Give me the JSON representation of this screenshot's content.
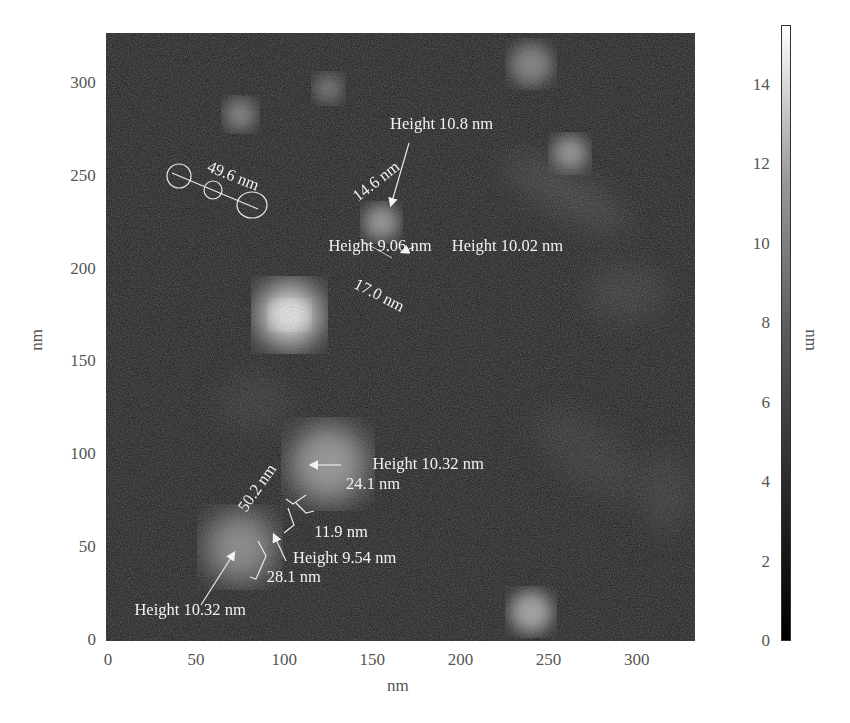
{
  "chart_data": {
    "type": "heatmap",
    "title": "",
    "xlabel": "nm",
    "ylabel": "nm",
    "xlim": [
      0,
      330
    ],
    "ylim": [
      0,
      330
    ],
    "x_ticks": [
      "0",
      "50",
      "100",
      "150",
      "200",
      "250",
      "300"
    ],
    "y_ticks": [
      "0",
      "50",
      "100",
      "150",
      "200",
      "250",
      "300"
    ],
    "colorbar": {
      "label": "nm",
      "range": [
        0,
        15.5
      ],
      "ticks": [
        "0",
        "2",
        "4",
        "6",
        "8",
        "10",
        "12",
        "14"
      ],
      "colormap": "gray"
    },
    "annotations": [
      {
        "text": "49.6 nm",
        "type": "length",
        "x": 57,
        "y": 255,
        "rotation": 22
      },
      {
        "text": "Height 10.8 nm",
        "type": "height",
        "x": 160,
        "y": 278
      },
      {
        "text": "14.6 nm",
        "type": "length",
        "x": 140,
        "y": 238,
        "rotation": -38
      },
      {
        "text": "Height 9.06 nm",
        "type": "height",
        "x": 125,
        "y": 212
      },
      {
        "text": "Height 10.02 nm",
        "type": "height",
        "x": 195,
        "y": 212
      },
      {
        "text": "17.0 nm",
        "type": "length",
        "x": 140,
        "y": 192,
        "rotation": 27
      },
      {
        "text": "Height 10.32 nm",
        "type": "height",
        "x": 150,
        "y": 95
      },
      {
        "text": "24.1 nm",
        "type": "length",
        "x": 135,
        "y": 84
      },
      {
        "text": "50.2 nm",
        "type": "length",
        "x": 76,
        "y": 70,
        "rotation": -55
      },
      {
        "text": "11.9 nm",
        "type": "length",
        "x": 117,
        "y": 58
      },
      {
        "text": "Height 9.54 nm",
        "type": "height",
        "x": 105,
        "y": 44
      },
      {
        "text": "28.1 nm",
        "type": "length",
        "x": 90,
        "y": 34
      },
      {
        "text": "Height 10.32 nm",
        "type": "height",
        "x": 15,
        "y": 16
      }
    ],
    "features": [
      {
        "x": 103,
        "y": 175,
        "r": 18,
        "intensity": 14,
        "label": "brightest particle"
      },
      {
        "x": 75,
        "y": 283,
        "r": 9,
        "intensity": 6
      },
      {
        "x": 125,
        "y": 297,
        "r": 8,
        "intensity": 5
      },
      {
        "x": 240,
        "y": 310,
        "r": 12,
        "intensity": 6
      },
      {
        "x": 262,
        "y": 262,
        "r": 10,
        "intensity": 8
      },
      {
        "x": 155,
        "y": 225,
        "r": 10,
        "intensity": 8
      },
      {
        "x": 240,
        "y": 15,
        "r": 12,
        "intensity": 9
      },
      {
        "x": 125,
        "y": 95,
        "r": 22,
        "intensity": 8
      },
      {
        "x": 75,
        "y": 50,
        "r": 20,
        "intensity": 7
      }
    ],
    "grid": false,
    "legend": "colorbar right"
  },
  "axes": {
    "x_title": "nm",
    "y_title": "nm",
    "colorbar_title": "nm"
  }
}
